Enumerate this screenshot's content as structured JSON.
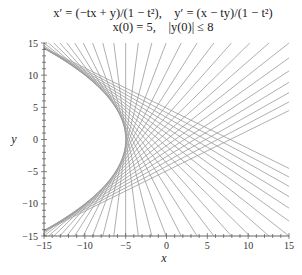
{
  "title": {
    "line1": "x′ = (−tx + y)/(1 − t²),    y′ = (x − ty)/(1 − t²)",
    "line2": "x(0) = 5,    |y(0)| ≤ 8"
  },
  "axes": {
    "xlabel": "x",
    "ylabel": "y",
    "xticks": [
      -15,
      -10,
      -5,
      0,
      5,
      10,
      15
    ],
    "yticks": [
      -15,
      -10,
      -5,
      0,
      5,
      10,
      15
    ],
    "xtick_labels": [
      "−15",
      "−10",
      "−5",
      "0",
      "5",
      "10",
      "15"
    ],
    "ytick_labels": [
      "−15",
      "−10",
      "−5",
      "0",
      "5",
      "10",
      "15"
    ]
  },
  "colors": {
    "line": "#9a9a9a",
    "axis": "#555555"
  },
  "chart_data": {
    "type": "line",
    "xlabel": "x",
    "ylabel": "y",
    "xlim": [
      -15,
      15
    ],
    "ylim": [
      -15,
      15
    ],
    "grid": false,
    "legend": "none",
    "family_description": "Straight-line solution curves 5x + b·y = b² − 25, enveloping the parabola x = −5 − y²/20",
    "parameter_name": "b",
    "parameter_values": [
      -8,
      -7.5,
      -7,
      -6.5,
      -6,
      -5.5,
      -5,
      -4.5,
      -4,
      -3.5,
      -3,
      -2.5,
      -2,
      -1.5,
      -1,
      -0.5,
      0,
      0.5,
      1,
      1.5,
      2,
      2.5,
      3,
      3.5,
      4,
      4.5,
      5,
      5.5,
      6,
      6.5,
      7,
      7.5,
      8
    ],
    "envelope": {
      "equation": "x = -5 - y^2/20",
      "vertex": [
        -5,
        0
      ]
    }
  }
}
